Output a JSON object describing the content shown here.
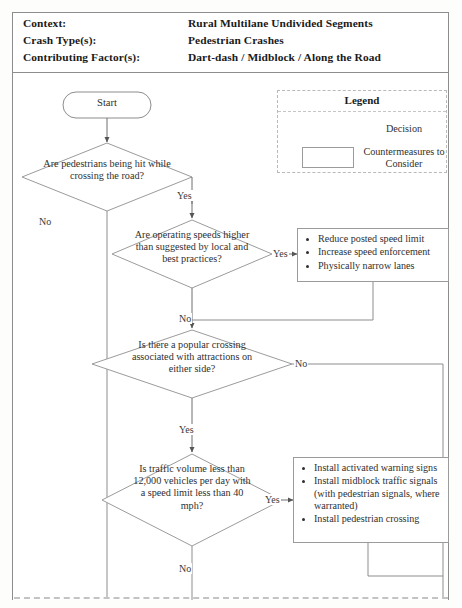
{
  "header": {
    "rows": [
      {
        "label": "Context:",
        "value": "Rural Multilane Undivided Segments"
      },
      {
        "label": "Crash Type(s):",
        "value": "Pedestrian Crashes"
      },
      {
        "label": "Contributing Factor(s):",
        "value": "Dart-dash / Midblock / Along the Road"
      }
    ]
  },
  "legend": {
    "title": "Legend",
    "decision_label": "Decision",
    "countermeasure_label": "Countermeasures to Consider"
  },
  "flow": {
    "start_label": "Start",
    "decisions": [
      {
        "id": "d1",
        "text": "Are pedestrians being hit while crossing the road?"
      },
      {
        "id": "d2",
        "text": "Are operating speeds higher than suggested by local and best practices?"
      },
      {
        "id": "d3",
        "text": "Is there a popular crossing associated with attractions on either side?"
      },
      {
        "id": "d4",
        "text": "Is traffic volume less than 12,000 vehicles per day with a speed limit less than 40 mph?"
      }
    ],
    "edge_labels": {
      "d1_no": "No",
      "d1_yes": "Yes",
      "d2_yes": "Yes",
      "d2_no": "No",
      "d3_no": "No",
      "d3_yes": "Yes",
      "d4_yes": "Yes",
      "d4_no": "No"
    },
    "countermeasures": [
      {
        "id": "cm1",
        "items": [
          "Reduce posted speed limit",
          "Increase speed enforcement",
          "Physically narrow lanes"
        ]
      },
      {
        "id": "cm2",
        "items": [
          "Install activated warning signs",
          "Install midblock traffic signals (with pedestrian signals, where warranted)",
          "Install pedestrian crossing"
        ]
      }
    ]
  },
  "colors": {
    "line": "#8d8d8d",
    "text": "#303030",
    "frame": "#8d8d8d",
    "background": "#ffffff"
  }
}
